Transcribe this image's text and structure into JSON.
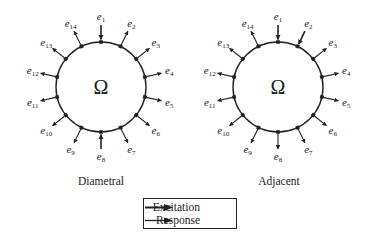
{
  "diagrams": [
    {
      "id": "diametral",
      "caption": "Diametral",
      "domain_symbol": "Ω",
      "excitation_electrodes": [
        1,
        8
      ]
    },
    {
      "id": "adjacent",
      "caption": "Adjacent",
      "domain_symbol": "Ω",
      "excitation_electrodes": [
        1,
        2
      ]
    }
  ],
  "electrodes": [
    {
      "base": "e",
      "index": "1"
    },
    {
      "base": "e",
      "index": "2"
    },
    {
      "base": "e",
      "index": "3"
    },
    {
      "base": "e",
      "index": "4"
    },
    {
      "base": "e",
      "index": "5"
    },
    {
      "base": "e",
      "index": "6"
    },
    {
      "base": "e",
      "index": "7"
    },
    {
      "base": "e",
      "index": "8"
    },
    {
      "base": "e",
      "index": "9"
    },
    {
      "base": "e",
      "index": "10"
    },
    {
      "base": "e",
      "index": "11"
    },
    {
      "base": "e",
      "index": "12"
    },
    {
      "base": "e",
      "index": "13"
    },
    {
      "base": "e",
      "index": "14"
    }
  ],
  "legend": {
    "excitation_label": "Excitation",
    "response_label": "Response"
  },
  "colors": {
    "ink": "#222222",
    "background": "#ffffff"
  }
}
